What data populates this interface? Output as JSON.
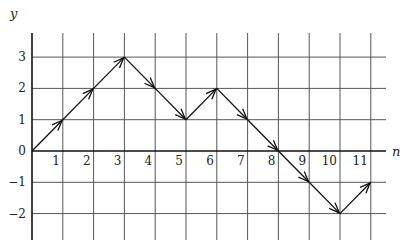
{
  "chart_data": {
    "type": "line",
    "title": "",
    "xlabel": "n",
    "ylabel": "y",
    "x_ticks": [
      1,
      2,
      3,
      4,
      5,
      6,
      7,
      8,
      9,
      10,
      11
    ],
    "y_ticks": [
      3,
      2,
      1,
      0,
      -1,
      -2
    ],
    "x_tick_labels": [
      "1",
      "2",
      "3",
      "4",
      "5",
      "6",
      "7",
      "8",
      "9",
      "10",
      "11"
    ],
    "y_tick_labels": [
      "3",
      "2",
      "1",
      "0",
      "−1",
      "−2"
    ],
    "xlim": [
      0,
      12
    ],
    "ylim": [
      -2.8,
      3.8
    ],
    "grid": true,
    "arrows_on_segments": true,
    "series": [
      {
        "name": "path",
        "x": [
          0,
          1,
          2,
          3,
          4,
          5,
          6,
          7,
          8,
          9,
          10,
          11
        ],
        "y": [
          0,
          1,
          2,
          3,
          2,
          1,
          2,
          1,
          0,
          -1,
          -2,
          -1
        ]
      }
    ]
  },
  "labels": {
    "y_axis": "y",
    "x_axis": "n"
  },
  "colors": {
    "grid": "#555555",
    "axis": "#111111",
    "path": "#111111"
  }
}
